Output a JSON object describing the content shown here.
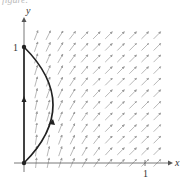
{
  "caption_fragment": "figure.",
  "diagram": {
    "type": "direction-field",
    "x_axis_label": "x",
    "y_axis_label": "y",
    "x_tick_label": "1",
    "y_tick_label": "1",
    "x_range": [
      0,
      1.1
    ],
    "y_range": [
      0,
      1.1
    ],
    "curve": {
      "description": "arc from (0,1) to (0,0) bulging right to about x=0.34",
      "direction": "from (0,0) up to (0,1)"
    },
    "segment_on_y_axis": {
      "from": [
        0,
        0
      ],
      "to": [
        0,
        1
      ],
      "direction": "upward"
    },
    "colors": {
      "axes": "#555555",
      "field_arrows": "#9a9a9a",
      "curve": "#222222"
    }
  }
}
